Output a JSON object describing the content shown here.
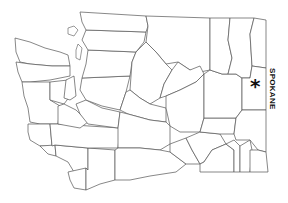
{
  "map": {
    "subject": "Washington State counties outline map",
    "marker": {
      "symbol": "*",
      "city": "SPOKANE"
    },
    "colors": {
      "background": "#ffffff",
      "boundary": "#555555",
      "marker": "#111111"
    }
  }
}
